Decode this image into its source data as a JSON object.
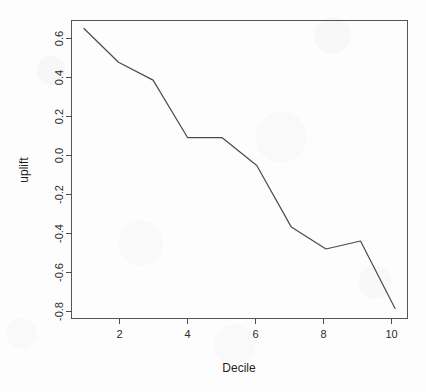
{
  "chart_data": {
    "type": "line",
    "title": "",
    "xlabel": "Decile",
    "ylabel": "uplift",
    "x": [
      1,
      2,
      3,
      4,
      5,
      6,
      7,
      8,
      9,
      10
    ],
    "values": [
      0.64,
      0.47,
      0.38,
      0.09,
      0.09,
      -0.05,
      -0.36,
      -0.47,
      -0.43,
      -0.77
    ],
    "series": [
      {
        "name": "uplift",
        "values": [
          0.64,
          0.47,
          0.38,
          0.09,
          0.09,
          -0.05,
          -0.36,
          -0.47,
          -0.43,
          -0.77
        ]
      }
    ],
    "xlim": [
      0.64,
      10.36
    ],
    "ylim": [
      -0.82,
      0.68
    ],
    "xticks": [
      2,
      4,
      6,
      8,
      10
    ],
    "xtick_labels": [
      "2",
      "4",
      "6",
      "8",
      "10"
    ],
    "yticks": [
      0.6,
      0.4,
      0.2,
      0.0,
      -0.2,
      -0.4,
      -0.6,
      -0.8
    ],
    "ytick_labels": [
      "0.6",
      "0.4",
      "0.2",
      "0.0",
      "-0.2",
      "-0.4",
      "-0.6",
      "-0.8"
    ],
    "grid": false,
    "legend": false,
    "legend_position": "none",
    "line_color": "#4a4a4a",
    "frame_color": "#555555",
    "background_color": "#fdfdfd"
  }
}
